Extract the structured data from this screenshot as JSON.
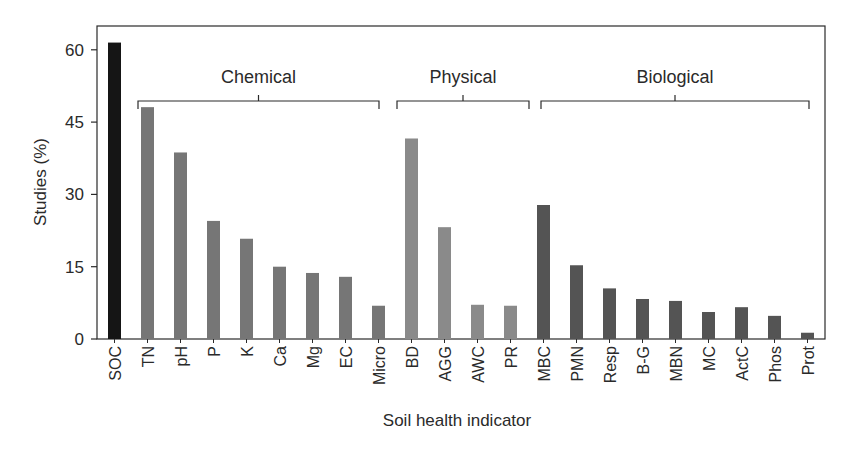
{
  "chart_data": {
    "type": "bar",
    "title": "",
    "xlabel": "Soil health indicator",
    "ylabel": "Studies (%)",
    "ylim": [
      0,
      65
    ],
    "yticks": [
      0,
      15,
      30,
      45,
      60
    ],
    "grid": false,
    "legend": null,
    "categories": [
      "SOC",
      "TN",
      "pH",
      "P",
      "K",
      "Ca",
      "Mg",
      "EC",
      "Micro",
      "BD",
      "AGG",
      "AWC",
      "PR",
      "MBC",
      "PMN",
      "Resp",
      "B-G",
      "MBN",
      "MC",
      "ActC",
      "Phos",
      "Prot"
    ],
    "values": [
      61.5,
      48.1,
      38.7,
      24.5,
      20.8,
      15.0,
      13.7,
      12.9,
      6.9,
      41.6,
      23.2,
      7.1,
      6.9,
      27.8,
      15.3,
      10.5,
      8.3,
      7.9,
      5.6,
      6.6,
      4.8,
      1.3
    ],
    "groups": [
      {
        "name": "Chemical",
        "categories": [
          "TN",
          "pH",
          "P",
          "K",
          "Ca",
          "Mg",
          "EC",
          "Micro"
        ],
        "color": "#767676"
      },
      {
        "name": "Physical",
        "categories": [
          "BD",
          "AGG",
          "AWC",
          "PR"
        ],
        "color": "#8a8a8a"
      },
      {
        "name": "Biological",
        "categories": [
          "MBC",
          "PMN",
          "Resp",
          "B-G",
          "MBN",
          "MC",
          "ActC",
          "Phos",
          "Prot"
        ],
        "color": "#545454"
      }
    ],
    "annotations": [
      "Chemical",
      "Physical",
      "Biological"
    ],
    "colors": {
      "SOC": "#151515",
      "Chemical": "#767676",
      "Physical": "#8a8a8a",
      "Biological": "#545454",
      "axis": "#2a2a2a"
    }
  }
}
